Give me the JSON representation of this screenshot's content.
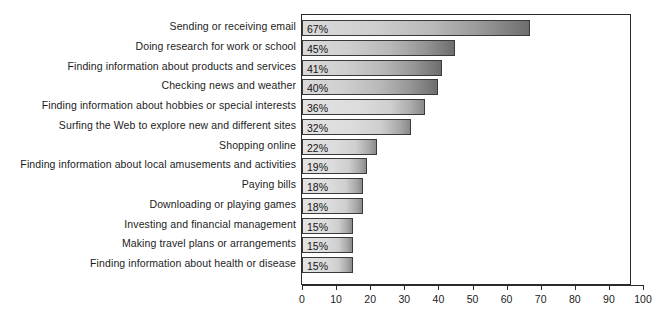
{
  "chart_data": {
    "type": "bar",
    "orientation": "horizontal",
    "title": "",
    "subtitle": "",
    "xlabel": "",
    "ylabel": "",
    "xlim": [
      0,
      100
    ],
    "xticks": [
      0,
      10,
      20,
      30,
      40,
      50,
      60,
      70,
      80,
      90,
      100
    ],
    "xtick_labels": [
      "0",
      "10",
      "20",
      "30",
      "40",
      "50",
      "60",
      "70",
      "80",
      "90",
      "100"
    ],
    "grid": false,
    "legend": null,
    "value_suffix": "%",
    "categories": [
      "Sending or receiving email",
      "Doing research for work or school",
      "Finding information about products and services",
      "Checking news and weather",
      "Finding information about hobbies or special interests",
      "Surfing the Web to explore new and different sites",
      "Shopping online",
      "Finding information about local amusements and activities",
      "Paying bills",
      "Downloading or playing games",
      "Investing and financial management",
      "Making travel plans or arrangements",
      "Finding information about health or disease"
    ],
    "values": [
      67,
      45,
      41,
      40,
      36,
      32,
      22,
      19,
      18,
      18,
      15,
      15,
      15
    ],
    "data_labels": [
      "67%",
      "45%",
      "41%",
      "40%",
      "36%",
      "32%",
      "22%",
      "19%",
      "18%",
      "18%",
      "15%",
      "15%",
      "15%"
    ],
    "colors": {
      "bar_fill_light": "#dcdcdc",
      "bar_fill_dark": "#8a8a8a",
      "bar_border": "#3a3a3a",
      "axis": "#2b2b2b",
      "text": "#1c1c1c",
      "background": "#ffffff"
    }
  }
}
